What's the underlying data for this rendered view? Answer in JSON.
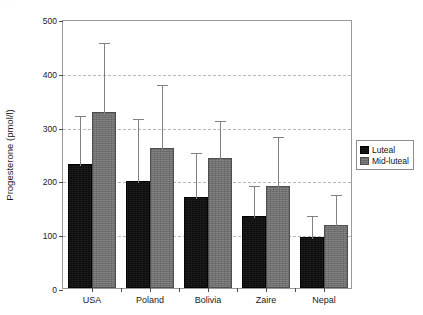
{
  "figure": {
    "scan_artifact_text": "···"
  },
  "chart_data": {
    "type": "bar",
    "title": "",
    "xlabel": "",
    "ylabel": "Progesterone (pmol/l)",
    "categories": [
      "USA",
      "Poland",
      "Bolivia",
      "Zaire",
      "Nepal"
    ],
    "ylim": [
      0,
      500
    ],
    "yticks": [
      0,
      100,
      200,
      300,
      400,
      500
    ],
    "ytick_labels": [
      "0",
      "100",
      "200",
      "300",
      "400",
      "500"
    ],
    "grid": true,
    "grid_axis": "y",
    "grid_style": "dashed",
    "legend_position": "right-outside",
    "series": [
      {
        "name": "Luteal",
        "color": "#0d0d0d",
        "values": [
          230,
          199,
          169,
          134,
          95
        ],
        "error_upper": [
          323,
          318,
          255,
          194,
          138
        ]
      },
      {
        "name": "Mid-luteal",
        "color": "#6e6e6e",
        "values": [
          327,
          260,
          242,
          190,
          117
        ],
        "error_upper": [
          459,
          381,
          314,
          284,
          176
        ]
      }
    ]
  },
  "legend": {
    "entries": [
      {
        "label": "Luteal"
      },
      {
        "label": "Mid-luteal"
      }
    ]
  }
}
